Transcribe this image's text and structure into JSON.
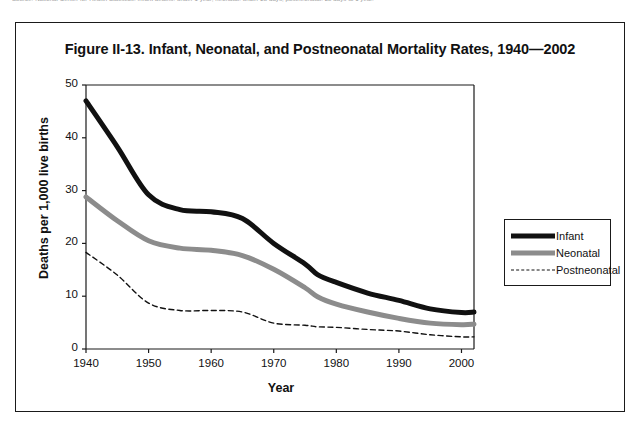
{
  "page": {
    "top_fragment_text": "Source: National Center for Health Statistics. Infant deaths: under 1 year; neonatal: under 28 days; postneonatal: 28 days to 1 year."
  },
  "figure": {
    "title": "Figure II-13. Infant, Neonatal, and Postneonatal Mortality Rates, 1940—2002"
  },
  "chart_data": {
    "type": "line",
    "title": "Figure II-13. Infant, Neonatal, and Postneonatal Mortality Rates, 1940—2002",
    "xlabel": "Year",
    "ylabel": "Deaths per 1,000 live births",
    "xlim": [
      1940,
      2002
    ],
    "ylim": [
      0,
      50
    ],
    "xticks": [
      1940,
      1950,
      1960,
      1970,
      1980,
      1990,
      2000
    ],
    "yticks": [
      0,
      10,
      20,
      30,
      40,
      50
    ],
    "xtick_labels": [
      "1940",
      "1950",
      "1960",
      "1970",
      "1980",
      "1990",
      "2000"
    ],
    "ytick_labels": [
      "0",
      "10",
      "20",
      "30",
      "40",
      "50"
    ],
    "grid": false,
    "legend_position": "right-outside",
    "x": [
      1940,
      1945,
      1950,
      1955,
      1960,
      1965,
      1970,
      1975,
      1977,
      1980,
      1985,
      1990,
      1995,
      2000,
      2002
    ],
    "series": [
      {
        "name": "Infant",
        "color": "#111111",
        "style": "solid",
        "width": 5,
        "values": [
          47.0,
          38.3,
          29.2,
          26.4,
          26.0,
          24.7,
          20.0,
          16.1,
          14.1,
          12.6,
          10.6,
          9.2,
          7.6,
          6.9,
          7.0
        ]
      },
      {
        "name": "Neonatal",
        "color": "#8c8c8c",
        "style": "solid",
        "width": 5,
        "values": [
          28.8,
          24.3,
          20.5,
          19.1,
          18.7,
          17.7,
          15.1,
          11.6,
          9.9,
          8.5,
          7.0,
          5.8,
          4.9,
          4.6,
          4.7
        ]
      },
      {
        "name": "Postneonatal",
        "color": "#111111",
        "style": "dashed",
        "width": 1.4,
        "values": [
          18.3,
          14.0,
          8.7,
          7.3,
          7.3,
          7.0,
          4.9,
          4.5,
          4.2,
          4.1,
          3.7,
          3.4,
          2.7,
          2.3,
          2.3
        ]
      }
    ]
  },
  "legend": {
    "items": [
      {
        "label": "Infant",
        "swatch": "thick-black-solid-line"
      },
      {
        "label": "Neonatal",
        "swatch": "thick-gray-solid-line"
      },
      {
        "label": "Postneonatal",
        "swatch": "thin-black-dashed-line"
      }
    ]
  },
  "colors": {
    "infant": "#111111",
    "neonatal": "#8c8c8c",
    "postneonatal": "#111111",
    "axis": "#1a1a1a",
    "background": "#ffffff"
  }
}
